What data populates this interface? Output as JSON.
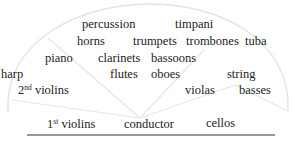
{
  "diagram": {
    "colors": {
      "text": "#222222",
      "arc": "#e4e4e4",
      "radial": "#e6e6e6",
      "baseline": "#333333"
    },
    "sections": {
      "percussion": "percussion",
      "timpani": "timpani",
      "horns": "horns",
      "trumpets": "trumpets",
      "trombones": "trombones",
      "tuba": "tuba",
      "piano": "piano",
      "clarinets": "clarinets",
      "bassoons": "bassoons",
      "harp": "harp",
      "flutes": "flutes",
      "oboes": "oboes",
      "string": "string",
      "violins2_num": "2",
      "violins2_sup": "nd",
      "violins2_text": " violins",
      "violas": "violas",
      "basses": "basses",
      "violins1_num": "1",
      "violins1_sup": "st",
      "violins1_text": " violins",
      "conductor": "conductor",
      "cellos": "cellos"
    }
  }
}
